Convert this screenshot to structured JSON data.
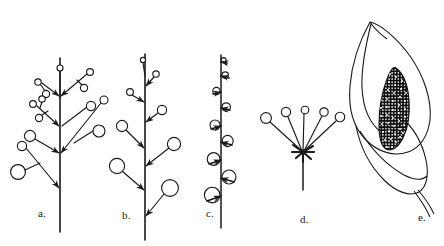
{
  "figure": {
    "kind": "botanical-line-drawing",
    "width": 444,
    "height": 246,
    "background_color": "#ffffff",
    "ink_color": "#1a1a1a"
  },
  "panels": [
    {
      "id": "a",
      "label": "a.",
      "label_x": 38,
      "label_y": 210,
      "name": "panicle",
      "axis": {
        "x": 60,
        "y_top": 58,
        "y_bottom": 232
      },
      "flower_fill": "#ffffff",
      "flower_stroke": "#1a1a1a",
      "branches": [
        {
          "node_x": 60,
          "node_y": 98,
          "tip_x": 60,
          "tip_y": 68,
          "flower_r": 3.0,
          "arrow": false
        },
        {
          "node_x": 60,
          "node_y": 98,
          "tip_x": 38,
          "tip_y": 82,
          "flower_r": 3.2,
          "arrow": true,
          "sub": [
            {
              "tip_x": 44,
              "tip_y": 92,
              "flower_r": 3.6
            }
          ]
        },
        {
          "node_x": 60,
          "node_y": 98,
          "tip_x": 90,
          "tip_y": 72,
          "flower_r": 3.4,
          "arrow": true,
          "sub": [
            {
              "tip_x": 83,
              "tip_y": 88,
              "flower_r": 3.6
            }
          ]
        },
        {
          "node_x": 60,
          "node_y": 128,
          "tip_x": 33,
          "tip_y": 104,
          "flower_r": 3.4,
          "arrow": true,
          "sub": [
            {
              "tip_x": 41,
              "tip_y": 100,
              "flower_r": 3.2
            },
            {
              "tip_x": 38,
              "tip_y": 117,
              "flower_r": 3.6
            }
          ]
        },
        {
          "node_x": 60,
          "node_y": 128,
          "tip_x": 91,
          "tip_y": 106,
          "flower_r": 4.6,
          "arrow": false
        },
        {
          "node_x": 60,
          "node_y": 155,
          "tip_x": 104,
          "tip_y": 100,
          "flower_r": 4.0,
          "arrow": true
        },
        {
          "node_x": 60,
          "node_y": 155,
          "tip_x": 99,
          "tip_y": 131,
          "flower_r": 6.0,
          "arrow": false
        },
        {
          "node_x": 60,
          "node_y": 155,
          "tip_x": 30,
          "tip_y": 136,
          "flower_r": 5.6,
          "arrow": true
        },
        {
          "node_x": 60,
          "node_y": 190,
          "tip_x": 22,
          "tip_y": 146,
          "flower_r": 4.6,
          "arrow": true,
          "sub": [
            {
              "tip_x": 18,
              "tip_y": 172,
              "flower_r": 7.4
            }
          ]
        }
      ]
    },
    {
      "id": "b",
      "label": "b.",
      "label_x": 122,
      "label_y": 212,
      "name": "raceme",
      "axis": {
        "x": 145,
        "y_top": 54,
        "y_bottom": 240
      },
      "flower_fill": "#ffffff",
      "flower_stroke": "#1a1a1a",
      "pedicels": [
        {
          "node_x": 145,
          "node_y": 78,
          "tip_x": 143,
          "tip_y": 60,
          "flower_r": 2.6,
          "arrow": false
        },
        {
          "node_x": 145,
          "node_y": 88,
          "tip_x": 156,
          "tip_y": 74,
          "flower_r": 3.2,
          "arrow": true
        },
        {
          "node_x": 145,
          "node_y": 104,
          "tip_x": 130,
          "tip_y": 92,
          "flower_r": 3.4,
          "arrow": true
        },
        {
          "node_x": 145,
          "node_y": 124,
          "tip_x": 162,
          "tip_y": 110,
          "flower_r": 4.6,
          "arrow": true
        },
        {
          "node_x": 145,
          "node_y": 150,
          "tip_x": 122,
          "tip_y": 126,
          "flower_r": 5.6,
          "arrow": true
        },
        {
          "node_x": 145,
          "node_y": 168,
          "tip_x": 174,
          "tip_y": 144,
          "flower_r": 6.6,
          "arrow": true
        },
        {
          "node_x": 145,
          "node_y": 192,
          "tip_x": 117,
          "tip_y": 166,
          "flower_r": 7.6,
          "arrow": true
        },
        {
          "node_x": 145,
          "node_y": 218,
          "tip_x": 170,
          "tip_y": 188,
          "flower_r": 8.4,
          "arrow": true
        }
      ]
    },
    {
      "id": "c",
      "label": "c.",
      "label_x": 206,
      "label_y": 210,
      "name": "spike",
      "axis": {
        "x": 221,
        "y_top": 55,
        "y_bottom": 228
      },
      "flower_fill": "#ffffff",
      "flower_stroke": "#1a1a1a",
      "sessile_flowers": [
        {
          "node_y": 62,
          "side": 1,
          "flower_r": 2.4
        },
        {
          "node_y": 76,
          "side": 1,
          "flower_r": 3.2
        },
        {
          "node_y": 92,
          "side": -1,
          "flower_r": 3.6
        },
        {
          "node_y": 108,
          "side": 1,
          "flower_r": 4.2
        },
        {
          "node_y": 126,
          "side": -1,
          "flower_r": 5.0
        },
        {
          "node_y": 142,
          "side": 1,
          "flower_r": 5.6
        },
        {
          "node_y": 160,
          "side": -1,
          "flower_r": 6.4
        },
        {
          "node_y": 178,
          "side": 1,
          "flower_r": 7.0
        },
        {
          "node_y": 196,
          "side": -1,
          "flower_r": 7.8
        }
      ]
    },
    {
      "id": "d",
      "label": "d.",
      "label_x": 300,
      "label_y": 216,
      "name": "umbel",
      "axis": {
        "x": 303,
        "y_top": 152,
        "y_bottom": 190
      },
      "hub_x": 303,
      "hub_y": 152,
      "flower_fill": "#ffffff",
      "flower_stroke": "#1a1a1a",
      "rays": [
        {
          "tip_x": 266,
          "tip_y": 118,
          "flower_r": 5.4
        },
        {
          "tip_x": 286,
          "tip_y": 112,
          "flower_r": 4.6
        },
        {
          "tip_x": 305,
          "tip_y": 110,
          "flower_r": 3.8
        },
        {
          "tip_x": 324,
          "tip_y": 112,
          "flower_r": 4.2
        },
        {
          "tip_x": 340,
          "tip_y": 117,
          "flower_r": 4.8
        }
      ]
    },
    {
      "id": "e",
      "label": "e.",
      "label_x": 418,
      "label_y": 214,
      "name": "spadix-and-spathe",
      "spadix_fill": "#111111",
      "spadix_dot_fill": "#ffffff",
      "spathe_stroke": "#1a1a1a"
    }
  ]
}
